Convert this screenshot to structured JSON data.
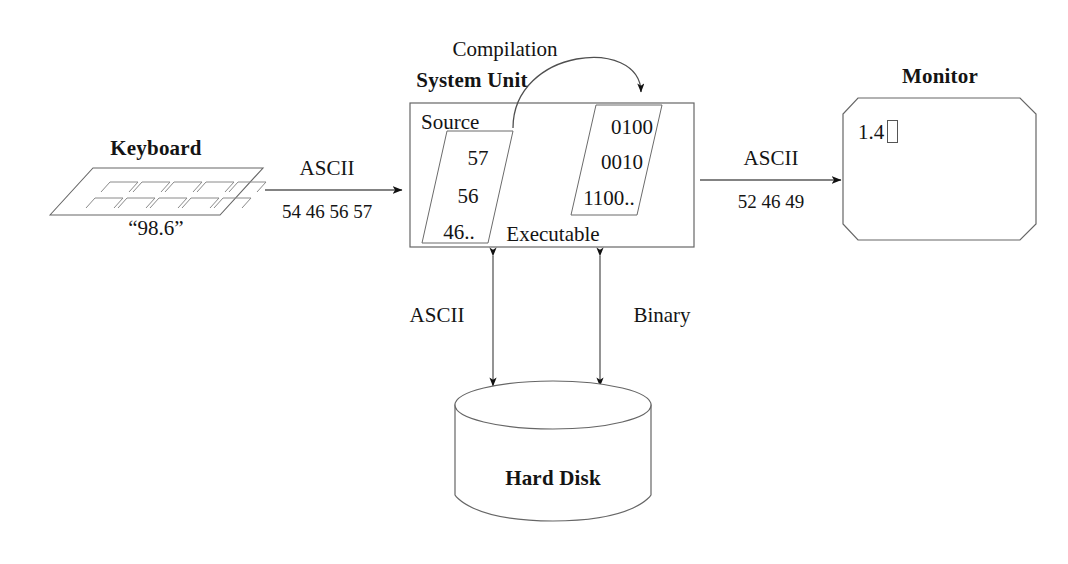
{
  "diagram": {
    "nodes": {
      "keyboard": {
        "title": "Keyboard",
        "caption": "“98.6”",
        "key_rows": 2,
        "keys_per_row": 5
      },
      "system_unit": {
        "title": "System Unit",
        "source_label": "Source",
        "source_lines": [
          "57",
          "56",
          "46.."
        ],
        "executable_label": "Executable",
        "executable_lines": [
          "0100",
          "0010",
          "1100.."
        ],
        "compilation_label": "Compilation"
      },
      "monitor": {
        "title": "Monitor",
        "screen_text": "1.4"
      },
      "hard_disk": {
        "title": "Hard Disk"
      }
    },
    "edges": {
      "keyboard_to_unit": {
        "top_label": "ASCII",
        "bottom_label": "54 46 56 57"
      },
      "unit_to_monitor": {
        "top_label": "ASCII",
        "bottom_label": "52 46 49"
      },
      "unit_to_disk_left": {
        "label": "ASCII"
      },
      "unit_to_disk_right": {
        "label": "Binary"
      }
    },
    "colors": {
      "stroke": "#4a4a4a",
      "stroke_dark": "#1a1a1a",
      "text": "#141414",
      "background": "#ffffff"
    }
  }
}
